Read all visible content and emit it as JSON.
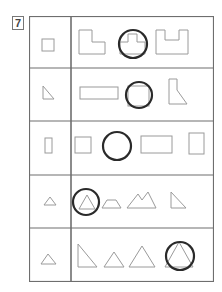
{
  "question": {
    "number": "7"
  },
  "colors": {
    "grid": "#6e6e6e",
    "shape": "#9a9a9a",
    "circle": "#2a2a2a"
  },
  "rows": [
    {
      "target": "small-square",
      "options": [
        "l-shape",
        "square-with-tab",
        "u-shape"
      ],
      "circled_index": 1
    },
    {
      "target": "right-triangle",
      "options": [
        "long-rectangle",
        "square",
        "trapezoid-notched"
      ],
      "circled_index": 1
    },
    {
      "target": "tall-rectangle",
      "options": [
        "square",
        "circle-option",
        "wide-rectangle",
        "tall-rectangle"
      ],
      "circled_index": 1
    },
    {
      "target": "small-triangle",
      "options": [
        "triangle",
        "trapezoid",
        "double-peak",
        "right-triangle"
      ],
      "circled_index": 0
    },
    {
      "target": "triangle",
      "options": [
        "right-triangle",
        "small-triangle",
        "large-triangle",
        "triangle"
      ],
      "circled_index": 3
    }
  ]
}
